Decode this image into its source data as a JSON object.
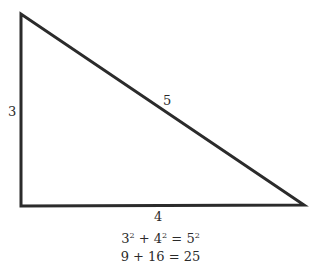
{
  "diagram": {
    "type": "right-triangle",
    "stroke_color": "#2b2b2b",
    "vertices": {
      "top_left": [
        21,
        14
      ],
      "bottom_left": [
        21,
        206
      ],
      "bottom_right": [
        304,
        205
      ]
    },
    "side_labels": {
      "vertical_leg": "3",
      "hypotenuse": "5",
      "horizontal_leg": "4"
    },
    "equations": {
      "line1": {
        "a": "3",
        "a_exp": "2",
        "plus": "+",
        "b": "4",
        "b_exp": "2",
        "eq": "=",
        "c": "5",
        "c_exp": "2"
      },
      "line2": "9 + 16 = 25"
    }
  }
}
